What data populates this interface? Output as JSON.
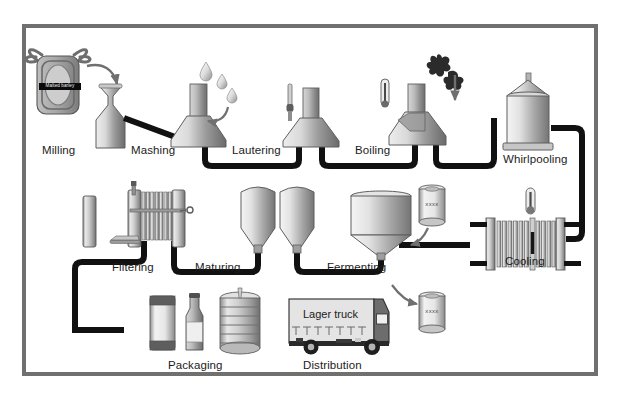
{
  "diagram": {
    "frame_color": "#70706f",
    "background_color": "#ffffff",
    "pipe_color": "#111111",
    "vessel_fill_light": "#f2f2f2",
    "vessel_fill_dark": "#707070"
  },
  "steps": [
    {
      "id": "milling",
      "label": "Milling",
      "x": 42,
      "y": 145
    },
    {
      "id": "mashing",
      "label": "Mashing",
      "x": 131,
      "y": 145
    },
    {
      "id": "lautering",
      "label": "Lautering",
      "x": 232,
      "y": 145
    },
    {
      "id": "boiling",
      "label": "Boiling",
      "x": 355,
      "y": 145
    },
    {
      "id": "whirlpooling",
      "label": "Whirlpooling",
      "x": 511,
      "y": 158
    },
    {
      "id": "cooling",
      "label": "Cooling",
      "x": 503,
      "y": 258
    },
    {
      "id": "fermenting",
      "label": "Fermenting",
      "x": 333,
      "y": 263
    },
    {
      "id": "maturing",
      "label": "Maturing",
      "x": 197,
      "y": 263
    },
    {
      "id": "filtering",
      "label": "Filtering",
      "x": 116,
      "y": 263
    },
    {
      "id": "packaging",
      "label": "Packaging",
      "x": 170,
      "y": 361
    },
    {
      "id": "distribution",
      "label": "Distribution",
      "x": 305,
      "y": 361
    }
  ],
  "annotations": {
    "malted_barley_bag": "Malted barley",
    "yeast_top": "XXXX",
    "yeast_bottom": "XXXX",
    "truck_side": "Lager truck"
  },
  "ingredients": [
    {
      "id": "malted-barley",
      "name": "Malted barley",
      "into": "mashing"
    },
    {
      "id": "water",
      "name": "water droplets",
      "into": "lautering"
    },
    {
      "id": "hops",
      "name": "hops",
      "into": "boiling"
    },
    {
      "id": "yeast-upper",
      "name": "yeast",
      "into": "fermenting"
    },
    {
      "id": "yeast-lower",
      "name": "yeast",
      "into": "fermenting"
    }
  ],
  "packaging_items": [
    "beer-can",
    "beer-bottle",
    "beer-keg"
  ]
}
